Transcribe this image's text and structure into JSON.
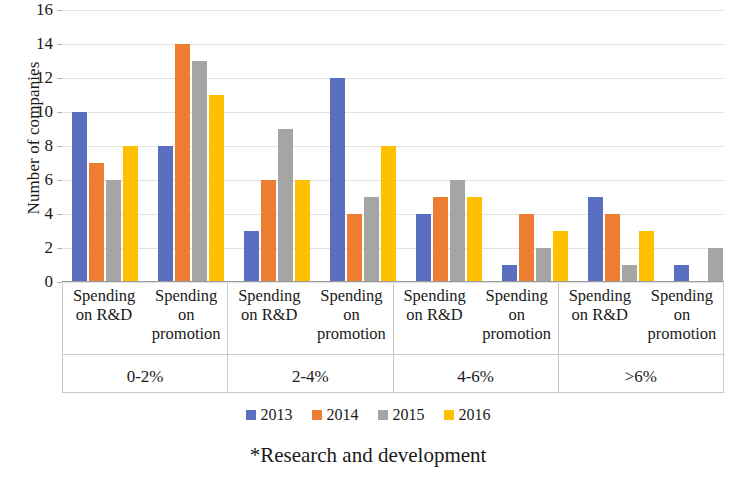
{
  "chart_data": {
    "type": "bar",
    "title": "",
    "xlabel": "",
    "ylabel": "Number of companies",
    "ylim": [
      0,
      16
    ],
    "yticks": [
      0,
      2,
      4,
      6,
      8,
      10,
      12,
      14,
      16
    ],
    "grid": true,
    "legend_position": "bottom",
    "footnote": "*Research and development",
    "categories": [
      "Spending on R&D",
      "Spending on promotion",
      "Spending on R&D",
      "Spending on promotion",
      "Spending on R&D",
      "Spending on promotion",
      "Spending on R&D",
      "Spending on promotion"
    ],
    "category_lines": [
      [
        "Spending",
        "on R&D"
      ],
      [
        "Spending",
        "on",
        "promotion"
      ],
      [
        "Spending",
        "on R&D"
      ],
      [
        "Spending",
        "on",
        "promotion"
      ],
      [
        "Spending",
        "on R&D"
      ],
      [
        "Spending",
        "on",
        "promotion"
      ],
      [
        "Spending",
        "on R&D"
      ],
      [
        "Spending",
        "on",
        "promotion"
      ]
    ],
    "groups": [
      "0-2%",
      "2-4%",
      "4-6%",
      ">6%"
    ],
    "series": [
      {
        "name": "2013",
        "color": "#5B6FC0",
        "values": [
          10,
          8,
          3,
          12,
          4,
          1,
          5,
          1
        ]
      },
      {
        "name": "2014",
        "color": "#ED7D31",
        "values": [
          7,
          14,
          6,
          4,
          5,
          4,
          4,
          0
        ]
      },
      {
        "name": "2015",
        "color": "#A5A5A5",
        "values": [
          6,
          13,
          9,
          5,
          6,
          2,
          1,
          2
        ]
      },
      {
        "name": "2016",
        "color": "#FFC000",
        "values": [
          8,
          11,
          6,
          8,
          5,
          3,
          3,
          0
        ]
      }
    ]
  }
}
